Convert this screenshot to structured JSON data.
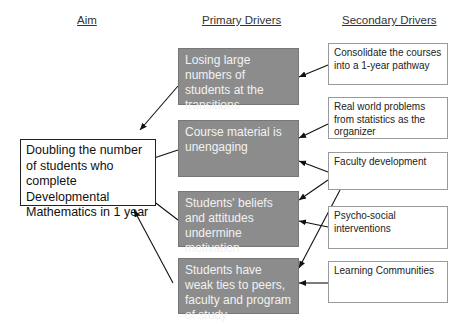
{
  "headers": {
    "aim": "Aim",
    "primary": "Primary Drivers",
    "secondary": "Secondary Drivers"
  },
  "aim": {
    "text": "Doubling the number of students who complete Developmental Mathematics in 1 year"
  },
  "primary_drivers": [
    {
      "text": "Losing large numbers of students at the transitions"
    },
    {
      "text": "Course material is unengaging"
    },
    {
      "text": "Students' beliefs and attitudes undermine motivation"
    },
    {
      "text": "Students have weak ties to peers, faculty and program of study"
    }
  ],
  "secondary_drivers": [
    {
      "text": "Consolidate the courses into a 1-year pathway"
    },
    {
      "text": "Real world problems from statistics as the organizer"
    },
    {
      "text": "Faculty development"
    },
    {
      "text": "Psycho-social interventions"
    },
    {
      "text": "Learning Communities"
    }
  ],
  "colors": {
    "primary_fill": "#8c8c8c",
    "primary_text": "#f2f2f2",
    "arrow": "#111111"
  },
  "connections": [
    {
      "from": "secondary_drivers.0",
      "to": "primary_drivers.0"
    },
    {
      "from": "secondary_drivers.1",
      "to": "primary_drivers.1"
    },
    {
      "from": "secondary_drivers.2",
      "to": "primary_drivers.1"
    },
    {
      "from": "secondary_drivers.2",
      "to": "primary_drivers.2"
    },
    {
      "from": "secondary_drivers.2",
      "to": "primary_drivers.3"
    },
    {
      "from": "secondary_drivers.3",
      "to": "primary_drivers.2"
    },
    {
      "from": "secondary_drivers.4",
      "to": "primary_drivers.3"
    },
    {
      "from": "primary_drivers.0",
      "to": "aim"
    },
    {
      "from": "primary_drivers.1",
      "to": "aim"
    },
    {
      "from": "primary_drivers.2",
      "to": "aim"
    },
    {
      "from": "primary_drivers.3",
      "to": "aim"
    }
  ]
}
